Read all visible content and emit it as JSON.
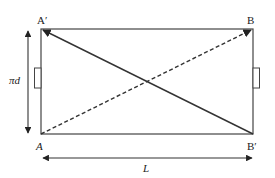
{
  "diagram": {
    "labels": {
      "top_left": "A′",
      "top_right": "B",
      "bottom_left": "A",
      "bottom_right": "B′",
      "height": "πd",
      "width": "L"
    },
    "lines": {
      "solid_diagonal": "A′ to B′",
      "dashed_diagonal": "A to B"
    },
    "colors": {
      "stroke": "#333333",
      "background": "#ffffff"
    }
  }
}
